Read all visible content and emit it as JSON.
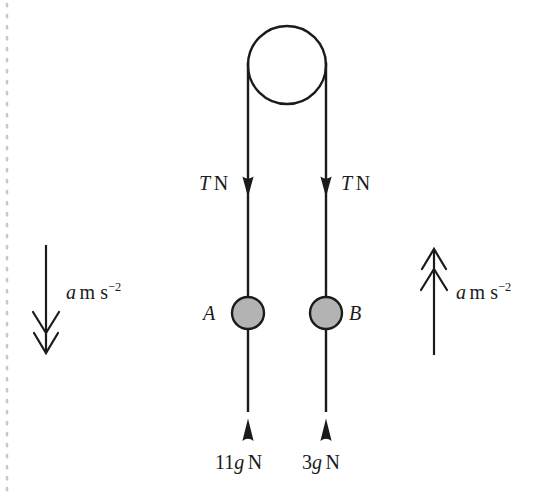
{
  "diagram": {
    "colors": {
      "stroke": "#1b1b1b",
      "mass_fill": "#b3b3b3",
      "background": "#ffffff",
      "margin_dots": "#c9c9c9"
    },
    "pulley": {
      "name": "pulley-wheel",
      "cx": 287,
      "cy": 65,
      "r": 39
    },
    "strings": [
      {
        "name": "string-left",
        "x": 248,
        "y_top": 65,
        "y_bottom": 440
      },
      {
        "name": "string-right",
        "x": 326,
        "y_top": 65,
        "y_bottom": 440
      }
    ],
    "tension_arrows": [
      {
        "name": "tension-arrow-left",
        "label": "T N",
        "symbol": "T",
        "unit": "N",
        "direction": "up"
      },
      {
        "name": "tension-arrow-right",
        "label": "T N",
        "symbol": "T",
        "unit": "N",
        "direction": "up"
      }
    ],
    "masses": [
      {
        "name": "mass-a",
        "label": "A",
        "cx": 248,
        "cy": 313,
        "r": 16,
        "label_side": "left"
      },
      {
        "name": "mass-b",
        "label": "B",
        "cx": 326,
        "cy": 313,
        "r": 16,
        "label_side": "right"
      }
    ],
    "weights": [
      {
        "name": "weight-left",
        "coefficient": "11",
        "symbol": "g",
        "unit": "N",
        "label": "11g N",
        "direction": "down"
      },
      {
        "name": "weight-right",
        "coefficient": "3",
        "symbol": "g",
        "unit": "N",
        "label": "3g N",
        "direction": "down"
      }
    ],
    "accelerations": [
      {
        "name": "acceleration-left",
        "symbol": "a",
        "units": "m s",
        "exponent": "−2",
        "label": "a m s⁻²",
        "direction": "down",
        "x": 46,
        "y_start": 245,
        "y_end": 355
      },
      {
        "name": "acceleration-right",
        "symbol": "a",
        "units": "m s",
        "exponent": "−2",
        "label": "a m s⁻²",
        "direction": "up",
        "x": 434,
        "y_start": 355,
        "y_end": 247
      }
    ]
  }
}
